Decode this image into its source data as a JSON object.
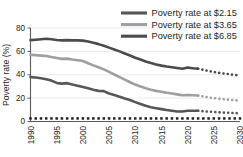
{
  "chart_data": {
    "type": "line",
    "title": "",
    "xlabel": "",
    "ylabel": "Poverty rate (%)",
    "xlim": [
      1990,
      2030
    ],
    "ylim": [
      0,
      80
    ],
    "grid": true,
    "legend_position": "top-right",
    "x_ticks": [
      "1990",
      "1995",
      "2000",
      "2005",
      "2010",
      "2015",
      "2020",
      "2025",
      "2030"
    ],
    "y_ticks": [
      "0",
      "20",
      "40",
      "60",
      "80"
    ],
    "x": [
      1990,
      1991,
      1992,
      1993,
      1994,
      1995,
      1996,
      1997,
      1998,
      1999,
      2000,
      2001,
      2002,
      2003,
      2004,
      2005,
      2006,
      2007,
      2008,
      2009,
      2010,
      2011,
      2012,
      2013,
      2014,
      2015,
      2016,
      2017,
      2018,
      2019,
      2020,
      2021,
      2022
    ],
    "x_projection": [
      2022,
      2023,
      2024,
      2025,
      2026,
      2027,
      2028,
      2029,
      2030
    ],
    "series": [
      {
        "name": "Poverty rate at $2.15",
        "color": "#55565a",
        "values": [
          38.0,
          37.6,
          37.0,
          36.2,
          35.0,
          33.0,
          32.4,
          32.8,
          31.6,
          30.6,
          29.6,
          28.4,
          27.2,
          26.2,
          26.0,
          24.0,
          22.6,
          21.2,
          19.6,
          18.4,
          16.6,
          15.0,
          13.4,
          12.2,
          11.4,
          10.6,
          9.8,
          9.2,
          8.6,
          8.6,
          9.2,
          9.2,
          9.2
        ],
        "projection": [
          9.2,
          8.8,
          8.4,
          8.2,
          7.8,
          7.6,
          7.4,
          7.2,
          7.0
        ]
      },
      {
        "name": "Poverty rate at $3.65",
        "color": "#9d9fa2",
        "values": [
          57.0,
          56.8,
          56.4,
          56.0,
          55.2,
          54.4,
          53.6,
          53.8,
          53.0,
          52.4,
          51.8,
          49.8,
          48.0,
          46.4,
          44.6,
          42.4,
          40.2,
          38.0,
          35.8,
          33.6,
          31.6,
          30.0,
          28.4,
          27.2,
          26.2,
          25.4,
          24.6,
          24.0,
          23.2,
          22.4,
          22.6,
          22.4,
          22.2
        ],
        "projection": [
          22.2,
          21.4,
          20.6,
          20.0,
          19.4,
          19.0,
          18.6,
          18.2,
          17.8
        ]
      },
      {
        "name": "Poverty rate at $6.85",
        "color": "#4a4b4f",
        "values": [
          69.6,
          70.0,
          70.4,
          70.8,
          70.4,
          69.8,
          69.4,
          69.6,
          69.4,
          69.4,
          69.2,
          68.4,
          67.4,
          66.2,
          64.8,
          63.2,
          61.6,
          60.0,
          58.2,
          56.4,
          54.6,
          53.0,
          51.4,
          50.0,
          48.8,
          47.8,
          47.0,
          46.4,
          45.8,
          45.2,
          46.2,
          45.6,
          45.2
        ],
        "projection": [
          45.2,
          44.2,
          43.2,
          42.4,
          41.6,
          41.0,
          40.4,
          39.8,
          39.4
        ]
      }
    ],
    "legend": [
      {
        "label": "Poverty rate at $2.15",
        "color": "#55565a"
      },
      {
        "label": "Poverty rate at $3.65",
        "color": "#9d9fa2"
      },
      {
        "label": "Poverty rate at $6.85",
        "color": "#4a4b4f"
      }
    ]
  }
}
